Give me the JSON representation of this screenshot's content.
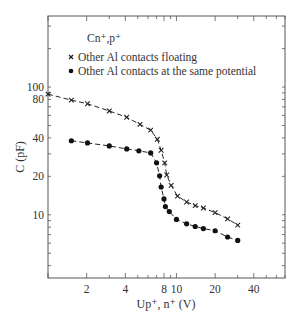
{
  "chart_data": {
    "type": "line",
    "title": "",
    "annotation": "Cn⁺,p⁺",
    "xlabel": "Up⁺, n⁺ (V)",
    "ylabel": "C (pF)",
    "xscale": "log",
    "yscale": "log",
    "xlim": [
      1,
      70
    ],
    "ylim": [
      3.2,
      360
    ],
    "xticks": [
      2,
      4,
      8,
      10,
      20,
      40
    ],
    "xtick_labels": [
      "2",
      "4",
      "8",
      "10",
      "20",
      "40"
    ],
    "yticks": [
      10,
      20,
      40,
      80,
      100
    ],
    "ytick_labels": [
      "10",
      "20",
      "40",
      "80",
      "100"
    ],
    "grid": false,
    "legend_position": "upper-left (inside plot)",
    "series": [
      {
        "name": "Other Al contacts floating",
        "marker": "x",
        "line": "dashed",
        "x": [
          1.0,
          1.52,
          2.03,
          3.0,
          4.1,
          5.2,
          6.3,
          7.1,
          7.6,
          8.1,
          8.4,
          9.1,
          10.2,
          12,
          14,
          16.2,
          20,
          25,
          30
        ],
        "y": [
          88,
          79,
          74,
          65,
          58,
          51,
          46,
          39,
          32,
          25.5,
          20.5,
          17,
          14,
          12.6,
          11.8,
          11.3,
          10.4,
          9.3,
          8.3
        ]
      },
      {
        "name": "Other Al contacts at the same potential",
        "marker": "o (filled)",
        "line": "dashed",
        "x": [
          1.52,
          2.03,
          3.0,
          4.1,
          5.1,
          6.3,
          7.0,
          7.4,
          7.6,
          8.0,
          8.2,
          8.8,
          10,
          12,
          14,
          16.2,
          20,
          25,
          30
        ],
        "y": [
          38,
          36.5,
          34.6,
          32.8,
          31.7,
          30.5,
          25.5,
          20.2,
          16.5,
          13.3,
          11.6,
          10.6,
          9.2,
          8.5,
          8.1,
          7.8,
          7.5,
          6.7,
          6.3
        ]
      }
    ]
  }
}
